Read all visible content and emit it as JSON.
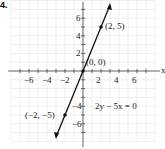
{
  "part_label": "4.",
  "chart_data": {
    "type": "line",
    "title": "",
    "equation": "2y − 5x = 0",
    "xlabel": "x",
    "ylabel": "",
    "xlim": [
      -8,
      8
    ],
    "ylim": [
      -8,
      8
    ],
    "grid": true,
    "x_tick_labels": [
      "−6",
      "−4",
      "−2",
      "2",
      "4",
      "6"
    ],
    "y_tick_labels": [
      "6",
      "4",
      "2",
      "−4",
      "−6"
    ],
    "x": [
      -3,
      3
    ],
    "y": [
      -7.5,
      7.5
    ],
    "points": [
      {
        "x": 2,
        "y": 5,
        "label": "(2, 5)"
      },
      {
        "x": 0,
        "y": 0,
        "label": "(0, 0)"
      },
      {
        "x": -2,
        "y": -5,
        "label": "(−2, −5)"
      }
    ]
  }
}
